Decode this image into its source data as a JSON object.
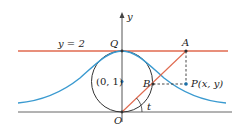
{
  "diagram": {
    "labels": {
      "y_axis": "y",
      "line_eq": "y = 2",
      "Q": "Q",
      "A": "A",
      "P": "P(x, y)",
      "B": "B",
      "center": "(0, 1)",
      "O": "O",
      "t": "t"
    },
    "colors": {
      "line_y2": "#e06a4f",
      "ray": "#e06a4f",
      "curve": "#3a9ad0",
      "circle": "#333333",
      "axes": "#555555",
      "dashed": "#333333",
      "point": "#1a6fa8"
    }
  }
}
